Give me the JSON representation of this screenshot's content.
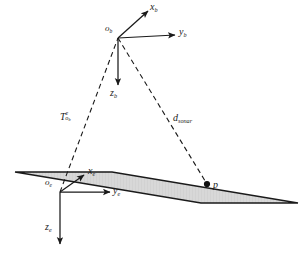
{
  "figure": {
    "background_color": "#ffffff",
    "line_color": "#1a1a1a",
    "plane_fill_color": "#d6d6d6",
    "plane_edge_color": "#1a1a1a"
  },
  "body_frame": {
    "origin_label": "o",
    "origin_subscript": "b",
    "x_axis_label": "x",
    "x_axis_subscript": "b",
    "y_axis_label": "y",
    "y_axis_subscript": "b",
    "z_axis_label": "z",
    "z_axis_subscript": "b"
  },
  "earth_frame": {
    "origin_label": "o",
    "origin_subscript": "e",
    "x_axis_label": "x",
    "x_axis_subscript": "e",
    "y_axis_label": "y",
    "y_axis_subscript": "e",
    "z_axis_label": "z",
    "z_axis_subscript": "e"
  },
  "annotations": {
    "transform_symbol": "T",
    "transform_superscript": "e",
    "transform_subscript": "o",
    "transform_subscript_sub": "b",
    "distance_symbol": "d",
    "distance_subscript": "sonar",
    "point_label": "p"
  },
  "geometry": {
    "body_origin": [
      118,
      38
    ],
    "earth_origin": [
      60,
      192
    ],
    "target_point": [
      207,
      184
    ],
    "plane_corners": "15,172 112,172 298,203 201,203"
  }
}
